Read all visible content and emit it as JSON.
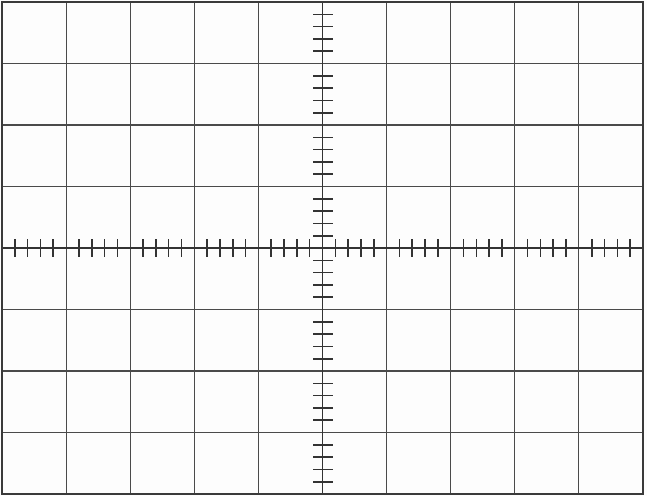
{
  "graticule": {
    "title": "Oscilloscope Graticule",
    "background_color": "#fdfdfd",
    "grid_line_color": "#4a4a4a",
    "border_color": "#3a3a3a",
    "axis_line_color": "#333333",
    "tick_color": "#333333",
    "grid_line_width": 1.1,
    "border_line_width": 1.4,
    "axis_line_width": 1.5,
    "tick_line_width": 1.6,
    "width": 647,
    "height": 496,
    "plot_left": 2,
    "plot_top": 2,
    "plot_right": 643,
    "plot_bottom": 494,
    "columns": 10,
    "rows": 8,
    "cell_width": 64.1,
    "cell_height": 61.5,
    "center_x": 322.5,
    "center_y": 248,
    "subdivisions_per_division": 5,
    "vertical_axis_tick_half_length": 10,
    "horizontal_axis_tick_half_length": 9,
    "x_gridlines": [
      2,
      66.1,
      130.2,
      194.3,
      258.4,
      322.5,
      386.6,
      450.7,
      514.8,
      578.9,
      643
    ],
    "y_gridlines": [
      2,
      63.5,
      125,
      186.5,
      248,
      309.5,
      371,
      432.5,
      494
    ],
    "labels": {
      "horizontal_axis": "horizontal-center-axis",
      "vertical_axis": "vertical-center-axis"
    }
  },
  "chart_data": {
    "type": "table",
    "xlabel": "",
    "ylabel": "",
    "grid": true,
    "legend": "none",
    "divisions_x": 10,
    "divisions_y": 8,
    "subdivisions_per_division": 5,
    "xlim": [
      -5,
      5
    ],
    "ylim": [
      -4,
      4
    ],
    "x_major_ticks": [
      -5,
      -4,
      -3,
      -2,
      -1,
      0,
      1,
      2,
      3,
      4,
      5
    ],
    "y_major_ticks": [
      -4,
      -3,
      -2,
      -1,
      0,
      1,
      2,
      3,
      4
    ],
    "x_minor_tick_step": 0.2,
    "y_minor_tick_step": 0.2,
    "series": [],
    "values": [],
    "categories": [],
    "annotations": []
  }
}
